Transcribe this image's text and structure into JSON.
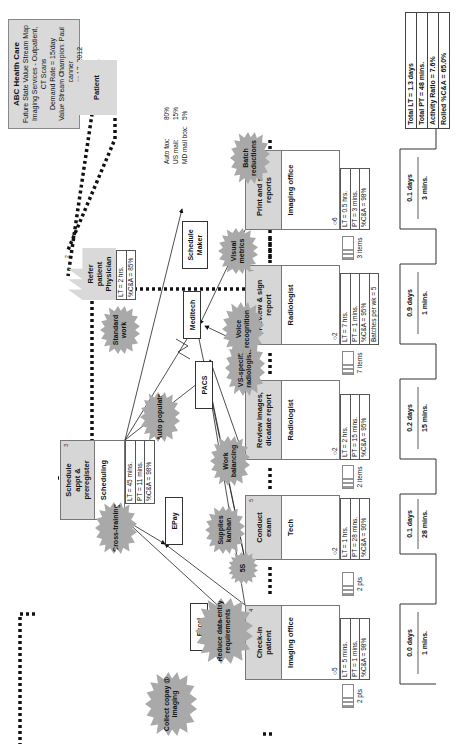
{
  "title_box": {
    "company": "ABC Health Care",
    "lines": [
      "Future State Value Stream Map",
      "Imaging Services - Outpatient, CT Scans",
      "Demand Rate = 15/day",
      "Value Stream Champion: Paul Scanner",
      "October 17, 2012"
    ]
  },
  "external": {
    "patient": {
      "num": "1",
      "label": "Patient"
    },
    "physician": {
      "num": "2",
      "label": "Refer patient Physician",
      "info": [
        "LT = 2 hrs.",
        "%C&A = 85%"
      ]
    }
  },
  "shipping": [
    {
      "label": "Auto fax:",
      "value": "80%"
    },
    {
      "label": "US mail:",
      "value": "15%"
    },
    {
      "label": "MD mail box:",
      "value": "5%"
    }
  ],
  "scheduling": {
    "num": "3",
    "title": "Schedule appt & preregister",
    "dept": "Scheduling",
    "ops": "6",
    "info": [
      "LT = 45 mins.",
      "PT = 11 mins.",
      "%C&A = 98%"
    ]
  },
  "systems": [
    "Excel",
    "EPay",
    "PACS",
    "Meditech",
    "Schedule Maker"
  ],
  "processes": [
    {
      "num": "4",
      "title": "Check-in patient",
      "dept": "Imaging office",
      "ops": "5",
      "info": [
        "LT = 5 mins.",
        "PT = 1 mins.",
        "%C&A = 98%"
      ]
    },
    {
      "num": "5",
      "title": "Conduct exam",
      "dept": "Tech",
      "ops": "2",
      "info": [
        "LT = 1 hrs.",
        "PT = 28 mins.",
        "%C&A = 90%"
      ]
    },
    {
      "num": "6",
      "title": "Review images, dicatate report",
      "dept": "Radiologist",
      "ops": "2",
      "info": [
        "LT = 2 hrs.",
        "PT = 15 mins.",
        "%C&A = 95%"
      ]
    },
    {
      "num": "7",
      "title": "Review & sign report",
      "dept": "Radiologist",
      "ops": "2",
      "info": [
        "LT = 7 hrs.",
        "PT = 1 mins.",
        "%C&A = 95%",
        "Batches per wk = 5"
      ]
    },
    {
      "num": "8",
      "title": "Print and send reports",
      "dept": "Imaging office",
      "ops": "6",
      "info": [
        "LT = 0.5 hrs.",
        "PT = 3 mins.",
        "%C&A = 98%"
      ]
    }
  ],
  "inventory": [
    "2 pts",
    "2 pts",
    "2 items",
    "7 items",
    "3 items"
  ],
  "timeline": [
    {
      "lt": "0.0 days",
      "pt": "1 mins."
    },
    {
      "lt": "0.1 days",
      "pt": "28 mins."
    },
    {
      "lt": "0.2 days",
      "pt": "15 mins."
    },
    {
      "lt": "0.9 days",
      "pt": "1 mins."
    },
    {
      "lt": "0.1 days",
      "pt": "3 mins."
    }
  ],
  "totals": [
    "Total LT = 1.3 days",
    "Total PT = 48 mins.",
    "Activity Ratio = 7.6%",
    "Rolled %C&A = 65.0%"
  ],
  "kaizen": {
    "collect_copay": "Collect copay @ imaging",
    "reduce_data": "Reduce data-entry requirements",
    "cross_training": "Cross-training",
    "supplies_kanban": "Supplies kanban",
    "five_s": "5S",
    "work_balancing": "Work balancing",
    "auto_populate": "Auto populate",
    "vs_specific": "VS-specific radiologists",
    "voice_recognition": "Voice recognition",
    "standard_work": "Standard work",
    "visual_metrics": "Visual metrics",
    "batch_reductions": "Batch reductions"
  }
}
